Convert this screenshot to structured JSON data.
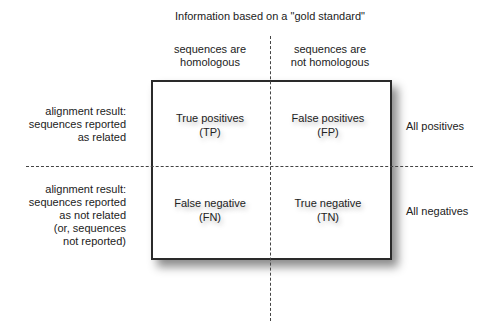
{
  "diagram": {
    "title": "Information based on a \"gold standard\"",
    "columns": [
      {
        "line1": "sequences are",
        "line2": "homologous"
      },
      {
        "line1": "sequences are",
        "line2": "not homologous"
      }
    ],
    "rows": [
      {
        "lines": [
          "alignment result:",
          "sequences reported",
          "as related"
        ],
        "summary": "All positives"
      },
      {
        "lines": [
          "alignment result:",
          "sequences reported",
          "as not related",
          "(or, sequences",
          "not reported)"
        ],
        "summary": "All negatives"
      }
    ],
    "cells": {
      "tp": {
        "label": "True positives",
        "abbr": "(TP)"
      },
      "fp": {
        "label": "False positives",
        "abbr": "(FP)"
      },
      "fn": {
        "label": "False negative",
        "abbr": "(FN)"
      },
      "tn": {
        "label": "True negative",
        "abbr": "(TN)"
      }
    },
    "colors": {
      "text": "#222222",
      "box_border": "#2a2a2a",
      "dash": "#444444",
      "background": "#ffffff"
    }
  }
}
